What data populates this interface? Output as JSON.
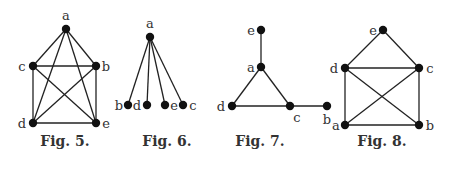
{
  "figures": [
    {
      "id": "fig5",
      "caption": "Fig. 5.",
      "vertices": [
        "a",
        "b",
        "c",
        "d",
        "e"
      ],
      "edges": [
        [
          "a",
          "c"
        ],
        [
          "a",
          "b"
        ],
        [
          "a",
          "d"
        ],
        [
          "a",
          "e"
        ],
        [
          "c",
          "b"
        ],
        [
          "c",
          "d"
        ],
        [
          "c",
          "e"
        ],
        [
          "b",
          "d"
        ],
        [
          "b",
          "e"
        ],
        [
          "d",
          "e"
        ]
      ]
    },
    {
      "id": "fig6",
      "caption": "Fig. 6.",
      "vertices": [
        "a",
        "b",
        "d",
        "e",
        "c"
      ],
      "edges": [
        [
          "a",
          "b"
        ],
        [
          "a",
          "d"
        ],
        [
          "a",
          "e"
        ],
        [
          "a",
          "c"
        ]
      ]
    },
    {
      "id": "fig7",
      "caption": "Fig. 7.",
      "vertices": [
        "e",
        "a",
        "d",
        "c",
        "b"
      ],
      "edges": [
        [
          "e",
          "a"
        ],
        [
          "a",
          "d"
        ],
        [
          "a",
          "c"
        ],
        [
          "d",
          "c"
        ],
        [
          "c",
          "b"
        ]
      ]
    },
    {
      "id": "fig8",
      "caption": "Fig. 8.",
      "vertices": [
        "e",
        "d",
        "c",
        "a",
        "b"
      ],
      "edges": [
        [
          "e",
          "d"
        ],
        [
          "e",
          "c"
        ],
        [
          "d",
          "c"
        ],
        [
          "d",
          "a"
        ],
        [
          "d",
          "b"
        ],
        [
          "c",
          "a"
        ],
        [
          "c",
          "b"
        ],
        [
          "a",
          "b"
        ]
      ]
    }
  ]
}
